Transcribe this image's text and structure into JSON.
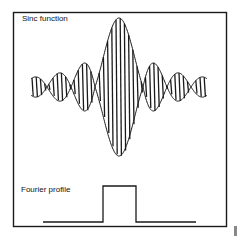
{
  "labels": {
    "top": "Sinc function",
    "bottom": "Fourier profile"
  },
  "colors": {
    "ink": "#1a1a1a",
    "background": "#ffffff"
  },
  "sinc": {
    "center_x": 119,
    "axis_y": 87,
    "amplitude": 69,
    "half_width": 88,
    "zero_spacing": 24,
    "carrier_period": 4.2
  },
  "pulse": {
    "baseline_y": 222,
    "top_y": 186,
    "x_start": 43,
    "x_rise": 103,
    "x_fall": 136,
    "x_end": 196
  }
}
